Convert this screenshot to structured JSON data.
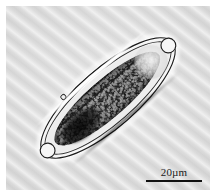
{
  "figure": {
    "kind": "photomicrograph",
    "modality": "light microscopy, brightfield",
    "background_color": "#d9d9d9",
    "border_color": "#ffffff"
  },
  "specimen": {
    "label": "elongated unicellular organism",
    "orientation_degrees": -41,
    "body_color": "#242424",
    "wall_color": "#1b1b1b",
    "halo_color": "#ffffff",
    "parts": [
      {
        "name": "cell-wall-outer",
        "label": "outer cell wall"
      },
      {
        "name": "cell-wall-inner",
        "label": "inner cell wall"
      },
      {
        "name": "protoplast",
        "label": "granular protoplast"
      },
      {
        "name": "vacuole-apical",
        "label": "apical vacuole"
      },
      {
        "name": "nucleus-mass",
        "label": "dense nuclear mass"
      },
      {
        "name": "papilla",
        "label": "lateral papilla"
      },
      {
        "name": "tip-proximal",
        "label": "proximal tip"
      },
      {
        "name": "tip-distal",
        "label": "distal tip"
      }
    ]
  },
  "scale_bar": {
    "value": 20,
    "unit": "µm",
    "label": "20µm",
    "line_color": "#111111",
    "position": "bottom-right"
  }
}
